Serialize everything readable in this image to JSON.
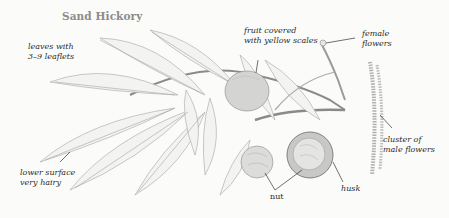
{
  "title": "Sand Hickory",
  "labels": {
    "leaves": [
      "leaves with",
      "3–9 leaflets"
    ],
    "fruit": [
      "fruit covered",
      "with yellow scales"
    ],
    "female_flowers": [
      "female",
      "flowers"
    ],
    "lower_surface": [
      "lower surface",
      "very hairy"
    ],
    "male_flowers": [
      "cluster of",
      "male flowers"
    ],
    "nut": "nut",
    "husk": "husk"
  },
  "colors": {
    "background": "#fbfbf9",
    "title": "#8c8c8c",
    "ink": "#2b2b2b",
    "drawing": "#9a9a9a"
  }
}
